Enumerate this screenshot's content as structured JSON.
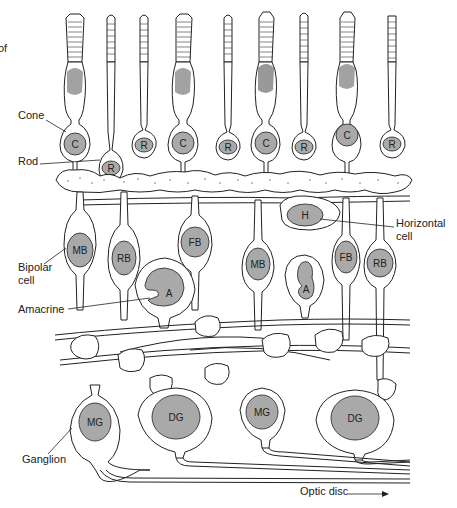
{
  "figure": {
    "partial_caption_fragment": "of",
    "type": "retina cell layer schematic"
  },
  "labels": {
    "cone": "Cone",
    "rod": "Rod",
    "bipolar_line1": "Bipolar",
    "bipolar_line2": "cell",
    "horizontal_line1": "Horizontal",
    "horizontal_line2": "cell",
    "amacrine": "Amacrine",
    "ganglion": "Ganglion",
    "optic_disc": "Optic disc"
  },
  "photoreceptors": [
    {
      "type": "cone",
      "nucleus": "C"
    },
    {
      "type": "rod",
      "nucleus": "R"
    },
    {
      "type": "rod",
      "nucleus": "R"
    },
    {
      "type": "cone",
      "nucleus": "C"
    },
    {
      "type": "rod",
      "nucleus": "R"
    },
    {
      "type": "cone",
      "nucleus": "C"
    },
    {
      "type": "rod",
      "nucleus": "R"
    },
    {
      "type": "cone",
      "nucleus": "C"
    },
    {
      "type": "rod",
      "nucleus": "R"
    }
  ],
  "interneurons": {
    "horizontal": "H",
    "bipolar": [
      "MB",
      "RB",
      "FB",
      "MB",
      "FB",
      "RB"
    ],
    "amacrine": [
      "A",
      "A"
    ]
  },
  "ganglion_cells": [
    "MG",
    "DG",
    "MG",
    "DG"
  ],
  "colors": {
    "nucleus_fill": "#a9a9a9",
    "outline": "#222222",
    "background": "#ffffff"
  }
}
